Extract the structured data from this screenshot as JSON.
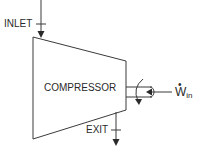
{
  "diagram": {
    "labels": {
      "inlet": "INLET",
      "exit": "EXIT",
      "component": "COMPRESSOR",
      "work_symbol": "W",
      "work_dot": "•",
      "work_subscript": "in"
    },
    "colors": {
      "stroke": "#3a3a3a",
      "text": "#2a2a2a",
      "background": "#ffffff"
    }
  }
}
